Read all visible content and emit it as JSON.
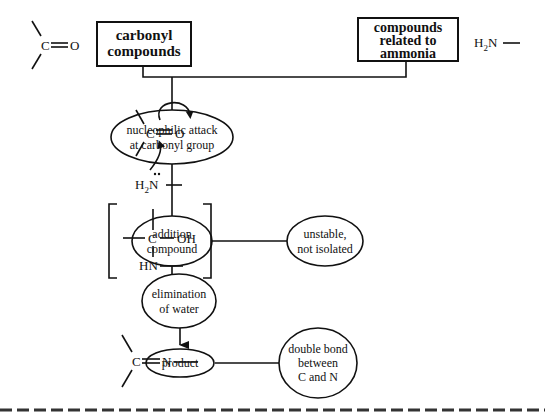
{
  "diagram": {
    "title": "",
    "boxes": {
      "carbonyl": [
        "carbonyl",
        "compounds"
      ],
      "ammonia": [
        "compounds",
        "related to",
        "ammonia"
      ]
    },
    "ellipses": {
      "nucleophilic": [
        "nucleophilic attack",
        "at carbonyl group"
      ],
      "addition": [
        "addition",
        "compound"
      ],
      "unstable": [
        "unstable,",
        "not isolated"
      ],
      "elimination": [
        "elimination",
        "of water"
      ],
      "product": [
        "product"
      ],
      "double_bond": [
        "double bond",
        "between",
        "C and N"
      ]
    },
    "structures": {
      "carbonyl_group": {
        "c": "C",
        "o": "O"
      },
      "amine_group": {
        "h2": "H",
        "sub": "2",
        "n": "N"
      },
      "attack": {
        "c": "C",
        "o": "O",
        "h": "H",
        "sub": "2",
        "n": "N"
      },
      "intermediate": {
        "c": "C",
        "oh": "OH",
        "hn": "HN"
      },
      "imine": {
        "c": "C",
        "n": "N"
      }
    }
  }
}
